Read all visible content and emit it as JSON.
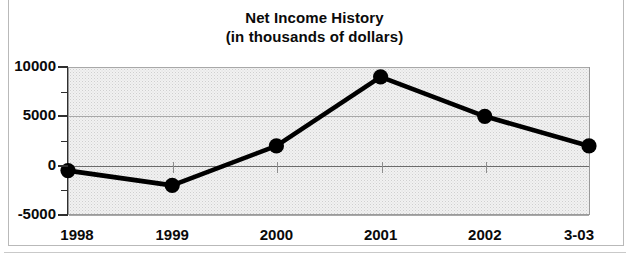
{
  "chart_data": {
    "type": "line",
    "title": "Net Income History",
    "subtitle": "(in thousands of dollars)",
    "xlabel": "",
    "ylabel": "",
    "categories": [
      "1998",
      "1999",
      "2000",
      "2001",
      "2002",
      "3-03"
    ],
    "values": [
      -500,
      -2000,
      2000,
      9000,
      5000,
      2000
    ],
    "series": [
      {
        "name": "Net Income",
        "values": [
          -500,
          -2000,
          2000,
          9000,
          5000,
          2000
        ]
      }
    ],
    "ylim": [
      -5000,
      10000
    ],
    "y_ticks": [
      -5000,
      0,
      5000,
      10000
    ],
    "y_tick_labels": [
      "-5000",
      "0",
      "5000",
      "10000"
    ],
    "y_minor_ticks": [
      -2500,
      2500,
      7500
    ],
    "grid": true,
    "legend": "none",
    "marker": "filled-circle",
    "line_color": "#000000",
    "marker_color": "#000000",
    "plot_background": "#f1f1f1",
    "gridline_color": "#a8a8a8",
    "axis_color": "#2f2f2f"
  },
  "figure": {
    "title": "Net Income History",
    "subtitle": "(in thousands of dollars)"
  }
}
